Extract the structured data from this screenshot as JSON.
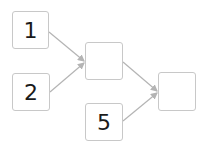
{
  "diagram": {
    "nodes": [
      {
        "id": "n1",
        "label": "1",
        "x": 12,
        "y": 11,
        "w": 37,
        "h": 38
      },
      {
        "id": "n2",
        "label": "2",
        "x": 12,
        "y": 73,
        "w": 38,
        "h": 38
      },
      {
        "id": "n3",
        "label": "",
        "x": 85,
        "y": 42,
        "w": 38,
        "h": 38
      },
      {
        "id": "n4",
        "label": "5",
        "x": 85,
        "y": 103,
        "w": 38,
        "h": 38
      },
      {
        "id": "n5",
        "label": "",
        "x": 158,
        "y": 72,
        "w": 38,
        "h": 39
      }
    ],
    "edges": [
      {
        "from": "n1",
        "to": "n3"
      },
      {
        "from": "n2",
        "to": "n3"
      },
      {
        "from": "n3",
        "to": "n5"
      },
      {
        "from": "n4",
        "to": "n5"
      }
    ],
    "colors": {
      "border": "#c8c8c8",
      "edge": "#b4b4b4",
      "text": "#1a1a1a"
    }
  }
}
